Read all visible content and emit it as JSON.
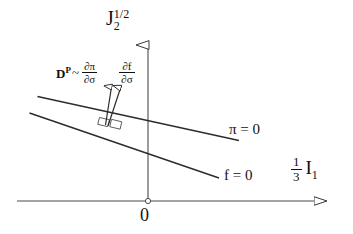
{
  "figure": {
    "title": "",
    "background_color": "#ffffff",
    "line_color": "#3a3a3a",
    "text_color": "#111111"
  },
  "axes": {
    "y_axis": {
      "label_base": "J",
      "label_sub": "2",
      "label_sup": "1/2",
      "name": "J_2^{1/2}",
      "arrow": "open-triangle-up"
    },
    "x_axis": {
      "label_fraction_num": "1",
      "label_fraction_den": "3",
      "label_var": "I",
      "label_var_sub": "1",
      "name": "(1/3) I_1",
      "arrow": "open-triangle-right"
    },
    "origin_label": "0"
  },
  "annotation": {
    "plastic_strain_symbol": "D",
    "plastic_strain_sup": "P",
    "tilde": "~",
    "potential_grad_num": "∂π",
    "potential_grad_den": "∂σ",
    "yield_grad_num": "∂f",
    "yield_grad_den": "∂σ",
    "full_text": "D^P ~ ∂π/∂σ    ∂f/∂σ"
  },
  "curves": [
    {
      "id": "potential-surface",
      "label": "π = 0",
      "description": "plastic potential surface, shallower slope"
    },
    {
      "id": "yield-surface",
      "label": "f = 0",
      "description": "yield surface, steeper slope"
    }
  ],
  "markers": {
    "right_angle_left": "right-angle-square",
    "right_angle_right": "right-angle-square",
    "origin_dot": "small-open-circle"
  },
  "vectors": [
    {
      "id": "d-pi-vector",
      "points_to": "potential gradient"
    },
    {
      "id": "d-f-vector",
      "points_to": "yield gradient"
    }
  ]
}
